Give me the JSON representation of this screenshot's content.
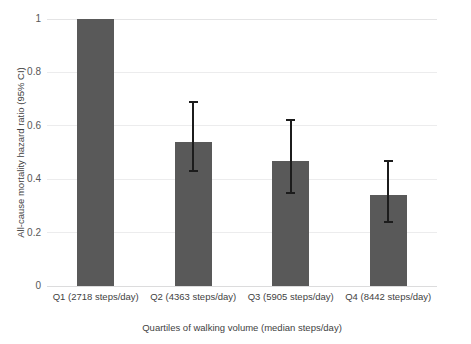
{
  "chart_data": {
    "type": "bar",
    "title": "",
    "xlabel": "Quartiles of walking volume (median steps/day)",
    "ylabel": "All-cause mortality hazard ratio (95% CI)",
    "categories": [
      "Q1 (2718 steps/day)",
      "Q2 (4363 steps/day)",
      "Q3 (5905 steps/day)",
      "Q4 (8442 steps/day)"
    ],
    "values": [
      1.0,
      0.54,
      0.47,
      0.34
    ],
    "ci_low": [
      null,
      0.43,
      0.35,
      0.24
    ],
    "ci_high": [
      null,
      0.69,
      0.62,
      0.47
    ],
    "ylim": [
      0,
      1
    ],
    "ytick_labels": [
      "1",
      "0.8",
      "0.6",
      "0.4",
      "0.2",
      "0"
    ],
    "ytick_values": [
      1,
      0.8,
      0.6,
      0.4,
      0.2,
      0
    ],
    "grid": true,
    "legend": "none",
    "bar_color": "#595959",
    "errorbar_color": "#1c1c1c",
    "gridline_color": "#ececed",
    "reference_category": "Q1 (2718 steps/day)",
    "reference_value": 1.0
  }
}
